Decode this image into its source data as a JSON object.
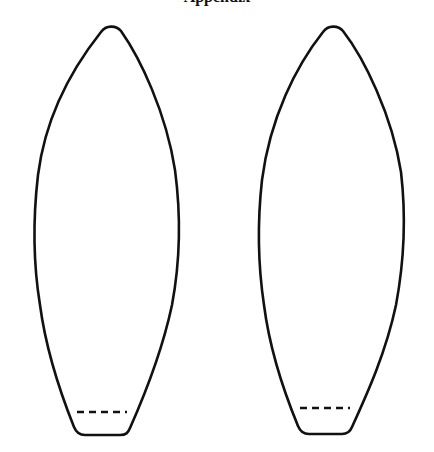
{
  "caption": {
    "text": "Appendix",
    "note": "clipped at top edge; only descenders visible"
  },
  "figure": {
    "type": "line-drawing",
    "stroke_color": "#111111",
    "background": "#ffffff",
    "shapes": [
      {
        "id": "left",
        "apex": [
          111,
          27
        ],
        "max_width_left_x": 34,
        "max_width_right_x": 178,
        "base_y": 434,
        "base_x": [
          78,
          126
        ],
        "dashed_line": {
          "y": 412,
          "x": [
            77,
            126
          ],
          "dash_count": 4
        }
      },
      {
        "id": "right",
        "apex": [
          333,
          27
        ],
        "max_width_left_x": 258,
        "max_width_right_x": 404,
        "base_y": 433,
        "base_x": [
          303,
          349
        ],
        "dashed_line": {
          "y": 408,
          "x": [
            300,
            349
          ],
          "dash_count": 4
        }
      }
    ]
  }
}
